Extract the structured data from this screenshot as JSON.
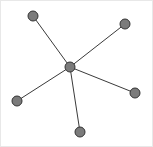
{
  "figure": {
    "width": 153,
    "height": 147,
    "background_color": "#ffffff",
    "border_color": "#e8e8e8"
  },
  "chart_data": {
    "type": "diagram",
    "diagram_type": "node-link-graph",
    "layout": "star",
    "title": "",
    "xlabel": "",
    "ylabel": "",
    "grid": false,
    "legend": null,
    "axis_visible": false,
    "node_count": 6,
    "edge_count": 5,
    "node_style": {
      "shape": "circle",
      "radius": 5,
      "fill_color": "#7b7b7b",
      "stroke_color": "#333333",
      "stroke_width": 1
    },
    "edge_style": {
      "stroke_color": "#3a3a3a",
      "stroke_width": 1,
      "directed": false
    },
    "nodes": [
      {
        "id": "n0",
        "label": "",
        "role": "center",
        "x": 69,
        "y": 66,
        "degree": 5
      },
      {
        "id": "n1",
        "label": "",
        "role": "peripheral",
        "x": 32,
        "y": 15,
        "degree": 1
      },
      {
        "id": "n2",
        "label": "",
        "role": "peripheral",
        "x": 124,
        "y": 23,
        "degree": 1
      },
      {
        "id": "n3",
        "label": "",
        "role": "peripheral",
        "x": 134,
        "y": 92,
        "degree": 1
      },
      {
        "id": "n4",
        "label": "",
        "role": "peripheral",
        "x": 79,
        "y": 131,
        "degree": 1
      },
      {
        "id": "n5",
        "label": "",
        "role": "peripheral",
        "x": 16,
        "y": 100,
        "degree": 1
      }
    ],
    "edges": [
      {
        "id": "e0",
        "source": "n0",
        "target": "n1",
        "label": ""
      },
      {
        "id": "e1",
        "source": "n0",
        "target": "n2",
        "label": ""
      },
      {
        "id": "e2",
        "source": "n0",
        "target": "n3",
        "label": ""
      },
      {
        "id": "e3",
        "source": "n0",
        "target": "n4",
        "label": ""
      },
      {
        "id": "e4",
        "source": "n0",
        "target": "n5",
        "label": ""
      }
    ],
    "annotations": []
  }
}
